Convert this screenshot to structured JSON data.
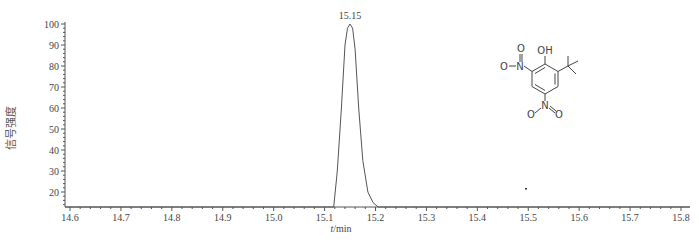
{
  "chart_data": {
    "type": "line",
    "title": "",
    "xlabel": "t/min",
    "xlabel_italic_part": "t",
    "xlabel_rest": "/min",
    "ylabel": "信号强度",
    "xlim": [
      14.58,
      15.83
    ],
    "ylim": [
      13,
      100
    ],
    "x_ticks": [
      "14.6",
      "14.7",
      "14.8",
      "14.9",
      "15.0",
      "15.1",
      "15.2",
      "15.3",
      "15.4",
      "15.5",
      "15.6",
      "15.7",
      "15.8"
    ],
    "y_ticks": [
      "20",
      "30",
      "40",
      "50",
      "60",
      "70",
      "80",
      "90",
      "100"
    ],
    "grid": false,
    "legend": null,
    "annotations": [
      {
        "text": "15.15",
        "x": 15.15,
        "y": 100
      }
    ],
    "series": [
      {
        "name": "signal",
        "x": [
          14.58,
          15.118,
          15.125,
          15.133,
          15.14,
          15.145,
          15.15,
          15.155,
          15.16,
          15.167,
          15.175,
          15.185,
          15.195,
          15.205,
          15.83
        ],
        "y": [
          13,
          13,
          30,
          60,
          90,
          98,
          100,
          98,
          88,
          60,
          35,
          20,
          15,
          13,
          13
        ]
      }
    ],
    "inset": {
      "type": "chemical-structure",
      "labels": [
        "OH",
        "O",
        "N",
        "O",
        "N",
        "O",
        "O"
      ],
      "description": "2-tert-butyl-4,6-dinitrophenol"
    },
    "line_color": "#555555"
  }
}
